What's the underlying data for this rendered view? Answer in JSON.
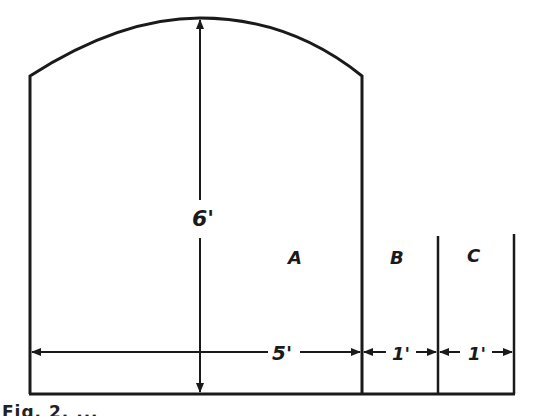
{
  "figure": {
    "caption_visible": "Fig. 2. ...",
    "stroke_color": "#1a1a1a",
    "background": "#ffffff"
  },
  "dimensions": {
    "height_label": "6'",
    "width_a_label": "5'",
    "width_b_label": "1'",
    "width_c_label": "1'"
  },
  "regions": {
    "a": "A",
    "b": "B",
    "c": "C"
  }
}
